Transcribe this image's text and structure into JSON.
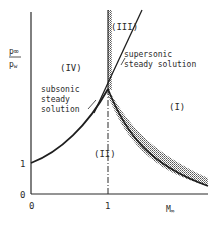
{
  "figure": {
    "y_axis_label_num": "p∞",
    "y_axis_label_den": "p",
    "y_axis_label_den_sub": "w",
    "x_axis_label": "M",
    "x_axis_label_sub": "∞",
    "y_tick_zero": "0",
    "y_tick_one": "1",
    "x_tick_zero": "0",
    "x_tick_one": "1",
    "region_I": "(I)",
    "region_II": "(II)",
    "region_III": "(III)",
    "region_IV": "(IV)",
    "subsonic_label_line1": "subsonic",
    "subsonic_label_line2": "steady",
    "subsonic_label_line3": "solution",
    "supersonic_label_line1": "supersonic",
    "supersonic_label_line2": "steady solution"
  },
  "colors": {
    "ink": "#2a2a2a",
    "shade": "#9a9a9a",
    "background": "#ffffff"
  }
}
